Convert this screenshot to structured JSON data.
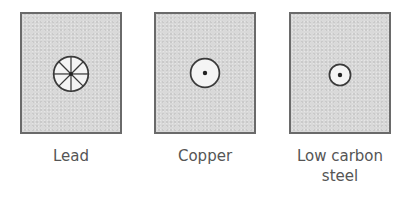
{
  "figure": {
    "panels": [
      {
        "id": "lead",
        "label": "Lead",
        "fracture_feature": "circle-with-radial-spokes",
        "circle_radius_px": 18,
        "spoke_count": 8,
        "has_center_dot": true
      },
      {
        "id": "copper",
        "label": "Copper",
        "fracture_feature": "circle-with-center-dot",
        "circle_radius_px": 15,
        "spoke_count": 0,
        "has_center_dot": true
      },
      {
        "id": "low-carbon-steel",
        "label_line1": "Low carbon",
        "label_line2": "steel",
        "fracture_feature": "circle-with-center-dot",
        "circle_radius_px": 11,
        "spoke_count": 0,
        "has_center_dot": true
      }
    ],
    "colors": {
      "panel_fill": "#d9d9d9",
      "panel_border": "#6a6a6a",
      "circle_fill": "#f4f4f4",
      "stroke": "#3a3a3a",
      "label_text": "#555555"
    }
  }
}
